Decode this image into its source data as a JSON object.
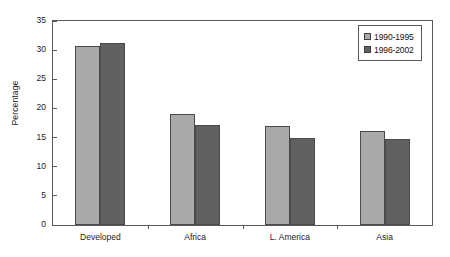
{
  "chart_data": {
    "type": "bar",
    "title": "",
    "subtitle": "",
    "xlabel": "",
    "ylabel": "Percentage",
    "categories": [
      "Developed",
      "Africa",
      "L. America",
      "Asia"
    ],
    "series": [
      {
        "name": "1990-1995",
        "values": [
          30.7,
          19.0,
          17.0,
          16.1
        ],
        "color": "#a9a9a9"
      },
      {
        "name": "1996-2002",
        "values": [
          31.2,
          17.2,
          14.9,
          14.7
        ],
        "color": "#616161"
      }
    ],
    "ylim": [
      0,
      35
    ],
    "ytick_step": 5,
    "ytick_labels": [
      "0",
      "5",
      "10",
      "15",
      "20",
      "25",
      "30",
      "35"
    ],
    "grid": false,
    "legend_position": "top-right",
    "frame": true
  },
  "legend": {
    "entries": [
      {
        "label": "1990-1995",
        "swatch": "legend-swatch-light"
      },
      {
        "label": "1996-2002",
        "swatch": "legend-swatch-dark"
      }
    ]
  },
  "axis": {
    "y_title": "Percentage"
  }
}
